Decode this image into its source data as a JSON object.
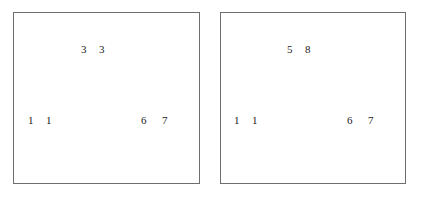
{
  "panels": [
    {
      "id": "left",
      "labels": {
        "top": [
          "3",
          "3"
        ],
        "bottom_left": [
          "1",
          "1"
        ],
        "bottom_right": [
          "6",
          "7"
        ]
      }
    },
    {
      "id": "right",
      "labels": {
        "top": [
          "5",
          "8"
        ],
        "bottom_left": [
          "1",
          "1"
        ],
        "bottom_right": [
          "6",
          "7"
        ]
      }
    }
  ]
}
